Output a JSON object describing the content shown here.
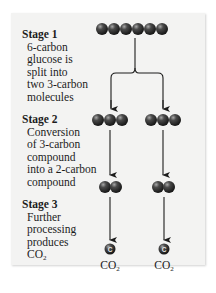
{
  "stages": [
    {
      "title": "Stage 1",
      "description_lines": [
        "6-carbon",
        "glucose is",
        "split into",
        "two 3-carbon",
        "molecules"
      ]
    },
    {
      "title": "Stage 2",
      "description_lines": [
        "Conversion",
        "of 3-carbon",
        "compound",
        "into a 2-carbon",
        "compound"
      ]
    },
    {
      "title": "Stage 3",
      "description_lines": [
        "Further",
        "processing",
        "produces"
      ],
      "product_text": "CO",
      "product_subscript": "2"
    }
  ],
  "products": [
    {
      "atom_label": "C",
      "text": "CO",
      "subscript": "2"
    },
    {
      "atom_label": "C",
      "text": "CO",
      "subscript": "2"
    }
  ],
  "molecules": {
    "glucose_carbons": 6,
    "stage2_carbons": 3,
    "stage3_carbons": 2,
    "stage4_carbons": 1
  },
  "colors": {
    "panel_bg": "#f3f3f2",
    "atom_fill": "#3a3a3a",
    "atom_highlight": "#9a9a9a",
    "line": "#1c1c1c"
  }
}
